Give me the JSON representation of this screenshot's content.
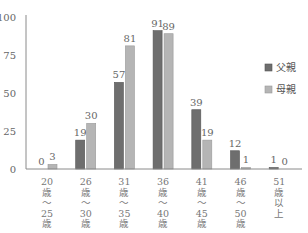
{
  "chart_data": {
    "type": "bar",
    "title": "",
    "xlabel": "",
    "ylabel": "",
    "ylim": [
      0,
      100
    ],
    "yticks": [
      0,
      25,
      50,
      75,
      100
    ],
    "grid": false,
    "legend_position": "right",
    "categories": [
      [
        "20",
        "歳",
        "〜",
        "25",
        "歳"
      ],
      [
        "26",
        "歳",
        "〜",
        "30",
        "歳"
      ],
      [
        "31",
        "歳",
        "〜",
        "35",
        "歳"
      ],
      [
        "36",
        "歳",
        "〜",
        "40",
        "歳"
      ],
      [
        "41",
        "歳",
        "〜",
        "45",
        "歳"
      ],
      [
        "46",
        "歳",
        "〜",
        "50",
        "歳"
      ],
      [
        "51",
        "歳",
        "以",
        "上"
      ]
    ],
    "category_labels": [
      "20歳〜25歳",
      "26歳〜30歳",
      "31歳〜35歳",
      "36歳〜40歳",
      "41歳〜45歳",
      "46歳〜50歳",
      "51歳以上"
    ],
    "series": [
      {
        "name": "父親",
        "color": "#6e6e6e",
        "border": "#555555",
        "values": [
          0,
          19,
          57,
          91,
          39,
          12,
          1
        ]
      },
      {
        "name": "母親",
        "color": "#b5b5b5",
        "border": "#999999",
        "values": [
          3,
          30,
          81,
          89,
          19,
          1,
          0
        ]
      }
    ]
  }
}
